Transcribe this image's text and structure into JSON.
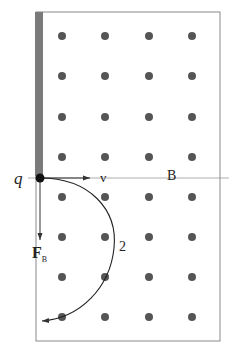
{
  "diagram": {
    "labels": {
      "charge": "q",
      "velocity": "v",
      "field": "B",
      "force": "F",
      "force_sub": "B",
      "path_label": "2"
    },
    "field_direction": "out-of-page (dots)",
    "grid": {
      "columns_x": [
        62,
        105,
        149,
        192
      ],
      "rows_y": [
        36,
        76,
        117,
        157,
        197,
        237,
        277,
        317
      ]
    },
    "colors": {
      "border": "#8a8a8a",
      "plate": "#7a7a7a",
      "dot": "#555555",
      "line": "#333333",
      "charge": "#111111"
    }
  }
}
